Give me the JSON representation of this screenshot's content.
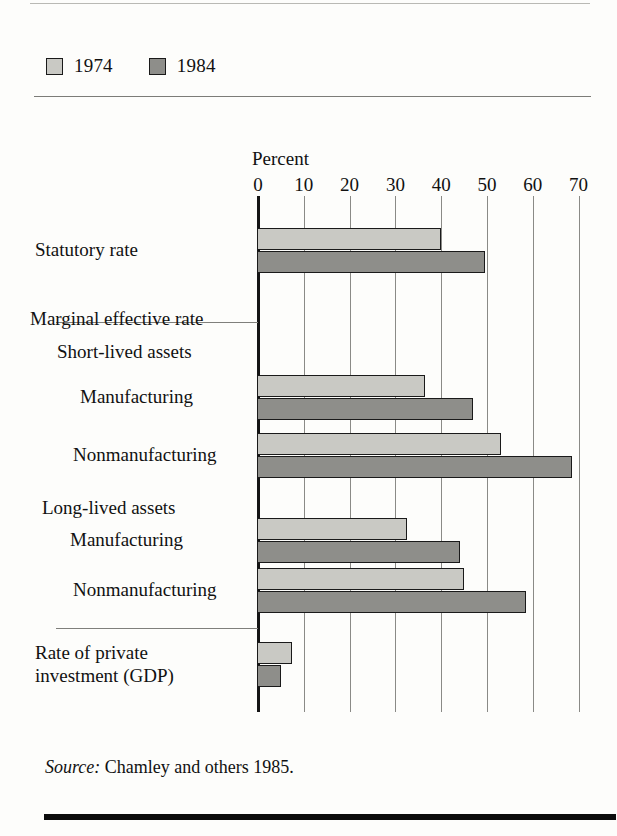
{
  "legend": {
    "items": [
      {
        "label": "1974",
        "color": "#c9c9c4",
        "key": "y1974"
      },
      {
        "label": "1984",
        "color": "#8e8e8a",
        "key": "y1984"
      }
    ]
  },
  "source": {
    "prefix": "Source:",
    "text": "Chamley and others 1985."
  },
  "chart_data": {
    "type": "bar",
    "orientation": "horizontal",
    "title": "",
    "xlabel": "Percent",
    "ylabel": "",
    "xlim": [
      0,
      70
    ],
    "xticks": [
      0,
      10,
      20,
      30,
      40,
      50,
      60,
      70
    ],
    "xtick_labels": [
      "0",
      "10",
      "20",
      "30",
      "40",
      "50",
      "60",
      "70"
    ],
    "grid": true,
    "legend_position": "top-left",
    "categories": [
      "Statutory rate",
      "Marginal effective rate",
      "Short-lived assets",
      "Manufacturing",
      "Nonmanufacturing",
      "Long-lived assets",
      "Manufacturing",
      "Nonmanufacturing",
      "Rate of private investment (GDP)"
    ],
    "series": [
      {
        "name": "1974",
        "color": "#c9c9c4",
        "values": [
          40,
          null,
          null,
          36.5,
          53,
          null,
          32.5,
          45,
          7.5
        ]
      },
      {
        "name": "1984",
        "color": "#8e8e8a",
        "values": [
          49.5,
          null,
          null,
          47,
          68.5,
          null,
          44,
          58.5,
          5
        ]
      }
    ],
    "rows": [
      {
        "label": "Statutory rate",
        "label_lines": [
          "Statutory rate"
        ],
        "kind": "data",
        "indent": 0,
        "values": {
          "y1974": 40,
          "y1984": 49.5
        }
      },
      {
        "label": "Marginal effective rate",
        "label_lines": [
          "Marginal effective rate"
        ],
        "kind": "heading",
        "indent": 0,
        "values": {}
      },
      {
        "label": "Short-lived assets",
        "label_lines": [
          "Short-lived assets"
        ],
        "kind": "subheading",
        "indent": 1,
        "values": {}
      },
      {
        "label": "Manufacturing",
        "label_lines": [
          "Manufacturing"
        ],
        "kind": "data",
        "indent": 2,
        "values": {
          "y1974": 36.5,
          "y1984": 47
        }
      },
      {
        "label": "Nonmanufacturing",
        "label_lines": [
          "Nonmanufacturing"
        ],
        "kind": "data",
        "indent": 2,
        "values": {
          "y1974": 53,
          "y1984": 68.5
        }
      },
      {
        "label": "Long-lived assets",
        "label_lines": [
          "Long-lived assets"
        ],
        "kind": "subheading",
        "indent": 1,
        "values": {}
      },
      {
        "label": "Manufacturing",
        "label_lines": [
          "Manufacturing"
        ],
        "kind": "data",
        "indent": 2,
        "values": {
          "y1974": 32.5,
          "y1984": 44
        }
      },
      {
        "label": "Nonmanufacturing",
        "label_lines": [
          "Nonmanufacturing"
        ],
        "kind": "data",
        "indent": 2,
        "values": {
          "y1974": 45,
          "y1984": 58.5
        }
      },
      {
        "label": "Rate of private investment (GDP)",
        "label_lines": [
          "Rate of private",
          "investment (GDP)"
        ],
        "kind": "data",
        "indent": 0,
        "values": {
          "y1974": 7.5,
          "y1984": 5
        }
      }
    ]
  }
}
